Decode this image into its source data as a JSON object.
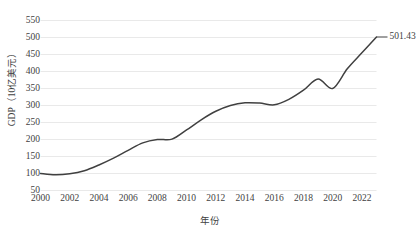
{
  "chart_data": {
    "type": "line",
    "title": "",
    "xlabel": "年份",
    "ylabel": "GDP（10亿美元）",
    "grid": true,
    "legend": "none",
    "xlim": [
      2000,
      2023
    ],
    "ylim": [
      50,
      550
    ],
    "ytick_step": 50,
    "xtick_step": 2,
    "yticks": [
      50,
      100,
      150,
      200,
      250,
      300,
      350,
      400,
      450,
      500,
      550
    ],
    "ytick_labels": [
      "50",
      "100",
      "150",
      "200",
      "250",
      "300",
      "350",
      "400",
      "450",
      "500",
      "550"
    ],
    "xticks": [
      2000,
      2002,
      2004,
      2006,
      2008,
      2010,
      2012,
      2014,
      2016,
      2018,
      2020,
      2022
    ],
    "xtick_labels": [
      "2000",
      "2002",
      "2004",
      "2006",
      "2008",
      "2010",
      "2012",
      "2014",
      "2016",
      "2018",
      "2020",
      "2022"
    ],
    "x": [
      2000,
      2001,
      2002,
      2003,
      2004,
      2005,
      2006,
      2007,
      2008,
      2009,
      2010,
      2011,
      2012,
      2013,
      2014,
      2015,
      2016,
      2017,
      2018,
      2019,
      2020,
      2021,
      2022,
      2023
    ],
    "series": [
      {
        "name": "GDP",
        "color": "#404040",
        "values": [
          100,
          96,
          99,
          108,
          125,
          145,
          168,
          190,
          200,
          201,
          228,
          258,
          283,
          300,
          308,
          307,
          302,
          318,
          345,
          378,
          350,
          408,
          455,
          501.43
        ]
      }
    ],
    "annotations": [
      {
        "name": "last-point-data-label",
        "text": "501.43",
        "x": 2023,
        "y": 501.43,
        "leader_line": true
      }
    ]
  },
  "colors": {
    "line": "#404040",
    "grid": "#e9e9e9",
    "text": "#3f3f3f",
    "background": "#ffffff"
  }
}
